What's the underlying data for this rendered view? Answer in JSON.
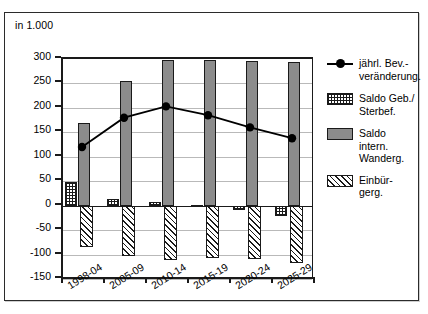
{
  "figure": {
    "unit_label": "in 1.000"
  },
  "chart_data": {
    "type": "bar",
    "title": "",
    "subtitle": "",
    "unit_note": "in 1.000",
    "xlabel": "",
    "ylabel": "",
    "ylim": [
      -150,
      300
    ],
    "ytick_step": 50,
    "grid": true,
    "legend_position": "right",
    "categories": [
      "1998-04",
      "2005-09",
      "2010-14",
      "2015-19",
      "2020-24",
      "2025-29"
    ],
    "ytick_labels": [
      "300",
      "250",
      "200",
      "150",
      "100",
      "50",
      "0",
      "-50",
      "-100",
      "-150"
    ],
    "ytick_values": [
      300,
      250,
      200,
      150,
      100,
      50,
      0,
      -50,
      -100,
      -150
    ],
    "series": [
      {
        "name": "Saldo Geb./Sterbef.",
        "type": "bar",
        "pattern": "crosshatch",
        "values": [
          48,
          13,
          8,
          2,
          -8,
          -22
        ]
      },
      {
        "name": "Saldo intern. Wanderg.",
        "type": "bar",
        "pattern": "solid-gray",
        "color": "#8c8c8c",
        "values": [
          170,
          255,
          298,
          297,
          295,
          294
        ]
      },
      {
        "name": "Einbürgerg.",
        "type": "bar",
        "pattern": "diagonal-hatch",
        "values": [
          -85,
          -102,
          -112,
          -108,
          -110,
          -118
        ]
      },
      {
        "name": "jährl. Bev.-veränderung",
        "type": "line",
        "marker": "filled-circle",
        "color": "#000000",
        "values": [
          120,
          180,
          203,
          185,
          160,
          138
        ]
      }
    ]
  },
  "legend": {
    "items": [
      {
        "key": "line",
        "label_line1": "jährl. Bev.-",
        "label_line2": "veränderung."
      },
      {
        "key": "cross",
        "label_line1": "Saldo Geb./",
        "label_line2": "Sterbef."
      },
      {
        "key": "gray",
        "label_line1": "Saldo intern.",
        "label_line2": "Wanderg."
      },
      {
        "key": "diag",
        "label_line1": "Einbür-",
        "label_line2": "gerg."
      }
    ]
  }
}
